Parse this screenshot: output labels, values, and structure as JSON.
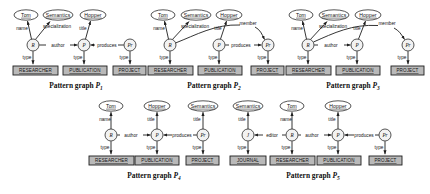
{
  "figure": {
    "caption_prefix": "Pattern graph",
    "colors": {
      "stroke": "#1e1e1e",
      "ellipse_fill": "#ffffff",
      "circle_fill": "#f2f2f2",
      "rect_fill": "#b9b9b9",
      "text": "#111111",
      "background": "#ffffff"
    }
  },
  "graphs": [
    {
      "id": "P1",
      "caption": "Pattern graph",
      "caption_sub": "1",
      "value_nodes": [
        {
          "label": "Tom"
        },
        {
          "label": "Semantics"
        },
        {
          "label": "Hopper"
        }
      ],
      "entity_nodes": [
        {
          "label": "R"
        },
        {
          "label": "P"
        },
        {
          "label": "Pr"
        }
      ],
      "class_nodes": [
        {
          "label": "RESEARCHER"
        },
        {
          "label": "PUBLICATION"
        },
        {
          "label": "PROJECT"
        }
      ],
      "edges": [
        {
          "label": "name"
        },
        {
          "label": "specialization"
        },
        {
          "label": "title"
        },
        {
          "label": "author"
        },
        {
          "label": "produces"
        },
        {
          "label": "type"
        },
        {
          "label": "type"
        },
        {
          "label": "type"
        }
      ]
    },
    {
      "id": "P2",
      "caption": "Pattern graph",
      "caption_sub": "2",
      "value_nodes": [
        {
          "label": "Tom"
        },
        {
          "label": "Semantics"
        },
        {
          "label": "Hopper"
        }
      ],
      "entity_nodes": [
        {
          "label": "R"
        },
        {
          "label": "P"
        },
        {
          "label": "Pr"
        }
      ],
      "class_nodes": [
        {
          "label": "RESEARCHER"
        },
        {
          "label": "PUBLICATION"
        },
        {
          "label": "PROJECT"
        }
      ],
      "edges": [
        {
          "label": "name"
        },
        {
          "label": "specialization"
        },
        {
          "label": "title"
        },
        {
          "label": "member"
        },
        {
          "label": "produces"
        },
        {
          "label": "type"
        },
        {
          "label": "type"
        },
        {
          "label": "type"
        }
      ]
    },
    {
      "id": "P3",
      "caption": "Pattern graph",
      "caption_sub": "3",
      "value_nodes": [
        {
          "label": "Tom"
        },
        {
          "label": "Semantics"
        },
        {
          "label": "Hopper"
        }
      ],
      "entity_nodes": [
        {
          "label": "R"
        },
        {
          "label": "P"
        },
        {
          "label": "Pr"
        }
      ],
      "class_nodes": [
        {
          "label": "RESEARCHER"
        },
        {
          "label": "PUBLICATION"
        },
        {
          "label": "PROJECT"
        }
      ],
      "edges": [
        {
          "label": "name"
        },
        {
          "label": "specialization"
        },
        {
          "label": "title"
        },
        {
          "label": "author"
        },
        {
          "label": "member"
        },
        {
          "label": "type"
        },
        {
          "label": "type"
        },
        {
          "label": "type"
        }
      ]
    },
    {
      "id": "P4",
      "caption": "Pattern graph",
      "caption_sub": "4",
      "value_nodes": [
        {
          "label": "Tom"
        },
        {
          "label": "Hopper"
        },
        {
          "label": "Semantics"
        }
      ],
      "entity_nodes": [
        {
          "label": "R"
        },
        {
          "label": "P"
        },
        {
          "label": "Pr"
        }
      ],
      "class_nodes": [
        {
          "label": "RESEARCHER"
        },
        {
          "label": "PUBLICATION"
        },
        {
          "label": "PROJECT"
        }
      ],
      "edges": [
        {
          "label": "name"
        },
        {
          "label": "title"
        },
        {
          "label": "title"
        },
        {
          "label": "author"
        },
        {
          "label": "produces"
        },
        {
          "label": "type"
        },
        {
          "label": "type"
        },
        {
          "label": "type"
        }
      ]
    },
    {
      "id": "P5",
      "caption": "Pattern graph",
      "caption_sub": "5",
      "value_nodes": [
        {
          "label": "Semantics"
        },
        {
          "label": "Tom"
        },
        {
          "label": "Hopper"
        }
      ],
      "entity_nodes": [
        {
          "label": "J"
        },
        {
          "label": "R"
        },
        {
          "label": "P"
        },
        {
          "label": "Pr"
        }
      ],
      "class_nodes": [
        {
          "label": "JOURNAL"
        },
        {
          "label": "RESEARCHER"
        },
        {
          "label": "PUBLICATION"
        },
        {
          "label": "PROJECT"
        }
      ],
      "edges": [
        {
          "label": "title"
        },
        {
          "label": "name"
        },
        {
          "label": "title"
        },
        {
          "label": "editor"
        },
        {
          "label": "author"
        },
        {
          "label": "produces"
        },
        {
          "label": "type"
        },
        {
          "label": "type"
        },
        {
          "label": "type"
        },
        {
          "label": "type"
        }
      ]
    }
  ]
}
